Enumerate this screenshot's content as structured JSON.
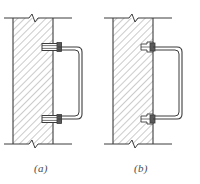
{
  "figure": {
    "background_color": "#ffffff",
    "line_color": "#3c3c3c",
    "hatch_color": "#7d7d7d",
    "caption_color": "#4a4a4a",
    "width": 200,
    "height": 184
  },
  "panels": [
    {
      "id": "a",
      "caption": "(a)",
      "description": "Handle secured with two through-bolt fasteners",
      "wall": {
        "left": 13,
        "right": 53,
        "top": 18,
        "bottom": 144,
        "hatch_angle": "45deg",
        "hatch_spacing": 5
      },
      "break_lines": [
        {
          "name": "top-break-line",
          "x1": 4,
          "x2": 72,
          "y": 18,
          "zigzag_x": 33
        },
        {
          "name": "bottom-break-line",
          "x1": 4,
          "x2": 72,
          "y": 144,
          "zigzag_x": 33
        }
      ],
      "fasteners": [
        {
          "name": "upper-bolt",
          "x": 43,
          "y": 46,
          "width": 18,
          "height": 7
        },
        {
          "name": "lower-bolt",
          "x": 43,
          "y": 118,
          "width": 18,
          "height": 7
        }
      ],
      "handle": {
        "name": "grab-handle",
        "top_arm_y": 49,
        "bottom_arm_y": 121,
        "inner_x": 57,
        "outer_x": 82,
        "corner_radius": 4,
        "bar_thickness": 3
      }
    },
    {
      "id": "b",
      "caption": "(b)",
      "description": "Handle secured with two embedded anchor fasteners",
      "wall": {
        "left": 113,
        "right": 153,
        "top": 18,
        "bottom": 144,
        "hatch_angle": "45deg",
        "hatch_spacing": 5
      },
      "break_lines": [
        {
          "name": "top-break-line",
          "x1": 104,
          "x2": 172,
          "y": 18,
          "zigzag_x": 133
        },
        {
          "name": "bottom-break-line",
          "x1": 104,
          "x2": 172,
          "y": 144,
          "zigzag_x": 133
        }
      ],
      "fasteners": [
        {
          "name": "upper-anchor",
          "x": 142,
          "y": 45,
          "width": 12,
          "height": 6
        },
        {
          "name": "lower-anchor",
          "x": 142,
          "y": 117,
          "width": 12,
          "height": 6
        }
      ],
      "handle": {
        "name": "grab-handle",
        "top_arm_y": 49,
        "bottom_arm_y": 121,
        "inner_x": 153,
        "outer_x": 182,
        "corner_radius": 4,
        "bar_thickness": 3
      }
    }
  ]
}
